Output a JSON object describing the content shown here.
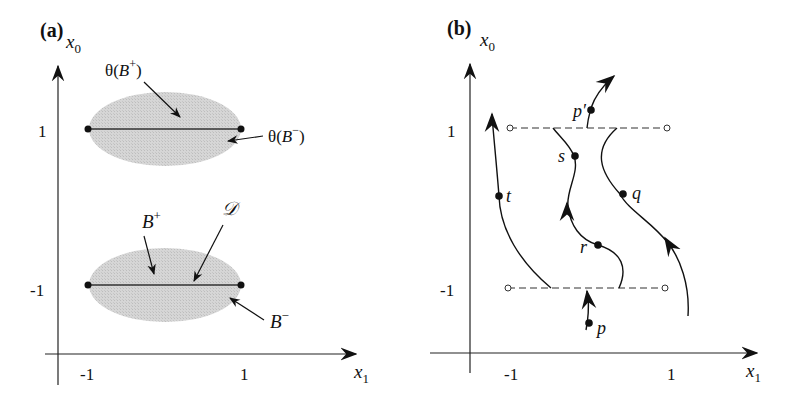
{
  "panel_a": {
    "title": "(a)",
    "y_axis_label": "x",
    "y_axis_sub": "0",
    "x_axis_label": "x",
    "x_axis_sub": "1",
    "y_ticks": [
      "1",
      "-1"
    ],
    "x_ticks": [
      "-1",
      "1"
    ],
    "annotations": {
      "theta_b_plus": {
        "pre": "θ(",
        "var": "B",
        "sup": "+",
        "post": ")"
      },
      "theta_b_minus": {
        "pre": "θ(",
        "var": "B",
        "sup": "−",
        "post": ")"
      },
      "b_plus": {
        "var": "B",
        "sup": "+"
      },
      "b_minus": {
        "var": "B",
        "sup": "−"
      },
      "domain_d": "𝒟"
    },
    "colors": {
      "region_fill": "#d4d4d4",
      "line": "#222222"
    }
  },
  "panel_b": {
    "title": "(b)",
    "y_axis_label": "x",
    "y_axis_sub": "0",
    "x_axis_label": "x",
    "x_axis_sub": "1",
    "y_ticks": [
      "1",
      "-1"
    ],
    "x_ticks": [
      "-1",
      "1"
    ],
    "points": {
      "p_prime": "p′",
      "s": "s",
      "t": "t",
      "q": "q",
      "r": "r",
      "p": "p"
    }
  }
}
